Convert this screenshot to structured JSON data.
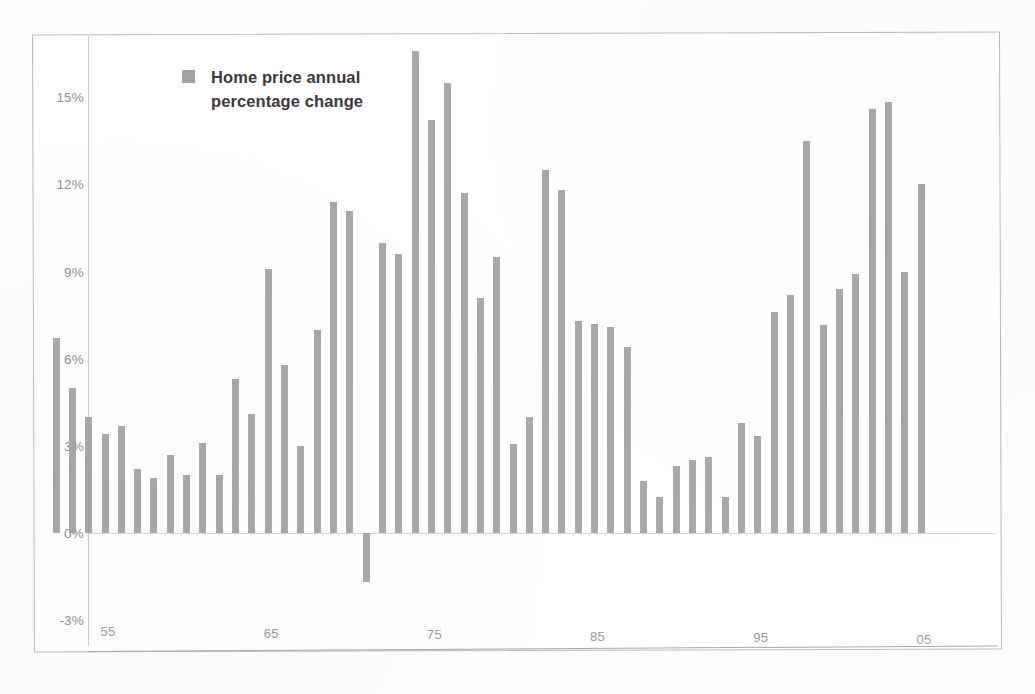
{
  "legend": {
    "label": "Home price annual percentage change",
    "swatch_color": "#a2a2a2",
    "icon": "legend-square-icon"
  },
  "axes": {
    "y_ticks": [
      "15%",
      "12%",
      "9%",
      "6%",
      "3%",
      "0%",
      "-3%"
    ],
    "y_tick_values": [
      15,
      12,
      9,
      6,
      3,
      0,
      -3
    ],
    "x_ticks": [
      "55",
      "65",
      "75",
      "85",
      "95",
      "05"
    ],
    "x_tick_values": [
      1955,
      1965,
      1975,
      1985,
      1995,
      2005
    ]
  },
  "style": {
    "bar_color": "#9d9d9d",
    "frame_color": "#b9b9b9",
    "axis_text_color": "#8e8e8e",
    "background": "#ffffff"
  },
  "chart_data": {
    "type": "bar",
    "title": "",
    "subtitle": "",
    "xlabel": "",
    "ylabel": "",
    "ylim": [
      -3,
      17
    ],
    "xlim": [
      1952,
      2006
    ],
    "grid": false,
    "legend_position": "top-left-inside",
    "series_name": "Home price annual percentage change",
    "units": "percent",
    "categories": [
      "52",
      "53",
      "54",
      "55",
      "56",
      "57",
      "58",
      "59",
      "60",
      "61",
      "62",
      "63",
      "64",
      "65",
      "66",
      "67",
      "68",
      "69",
      "70",
      "71",
      "72",
      "73",
      "74",
      "75",
      "76",
      "77",
      "78",
      "79",
      "80",
      "81",
      "82",
      "83",
      "84",
      "85",
      "86",
      "87",
      "88",
      "89",
      "90",
      "91",
      "92",
      "93",
      "94",
      "95",
      "96",
      "97",
      "98",
      "99",
      "00",
      "01",
      "02",
      "03",
      "04",
      "05"
    ],
    "x": [
      1952,
      1953,
      1954,
      1955,
      1956,
      1957,
      1958,
      1959,
      1960,
      1961,
      1962,
      1963,
      1964,
      1965,
      1966,
      1967,
      1968,
      1969,
      1970,
      1971,
      1972,
      1973,
      1974,
      1975,
      1976,
      1977,
      1978,
      1979,
      1980,
      1981,
      1982,
      1983,
      1984,
      1985,
      1986,
      1987,
      1988,
      1989,
      1990,
      1991,
      1992,
      1993,
      1994,
      1995,
      1996,
      1997,
      1998,
      1999,
      2000,
      2001,
      2002,
      2003,
      2004,
      2005
    ],
    "values": [
      6.7,
      5.0,
      4.0,
      3.4,
      3.7,
      2.2,
      1.9,
      2.7,
      2.0,
      3.1,
      2.0,
      5.3,
      4.1,
      9.1,
      5.8,
      3.0,
      7.0,
      11.4,
      11.1,
      -1.7,
      10.0,
      9.6,
      16.6,
      14.2,
      15.5,
      11.7,
      8.1,
      9.5,
      3.05,
      4.0,
      12.5,
      11.8,
      7.3,
      7.2,
      7.1,
      6.4,
      1.8,
      1.25,
      2.3,
      2.5,
      2.6,
      1.25,
      3.8,
      3.35,
      7.6,
      8.2,
      13.5,
      7.15,
      8.4,
      8.9,
      14.6,
      14.85,
      9.0,
      12.0
    ],
    "peak": {
      "year": 1974,
      "value": 16.6
    },
    "trough": {
      "year": 1971,
      "value": -1.7
    }
  }
}
